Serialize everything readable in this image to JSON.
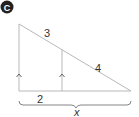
{
  "badge": {
    "label": "C",
    "color": "#222222"
  },
  "diagram": {
    "line_color": "#b8b8b8",
    "labels": {
      "upper_hypotenuse": "3",
      "lower_hypotenuse": "4",
      "base_left": "2",
      "base_total": "x"
    },
    "parallel_marks": [
      "left-side-arrow",
      "inner-segment-arrow"
    ]
  }
}
